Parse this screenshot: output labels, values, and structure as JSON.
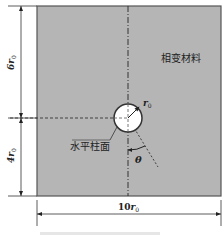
{
  "diagram": {
    "type": "geometry-schematic",
    "domain_region": {
      "label": "相变材料",
      "fill_color": "#b5b5b5",
      "border_color": "#555555"
    },
    "cylinder": {
      "label": "水平柱面",
      "radius_label": "r",
      "radius_subscript": "0",
      "fill_color": "#ffffff"
    },
    "angle": {
      "label": "θ"
    },
    "dimensions": {
      "top_height": {
        "coef": "6",
        "symbol": "r",
        "sub": "0"
      },
      "bottom_height": {
        "coef": "4",
        "symbol": "r",
        "sub": "0"
      },
      "width": {
        "coef": "10",
        "symbol": "r",
        "sub": "0"
      }
    }
  }
}
